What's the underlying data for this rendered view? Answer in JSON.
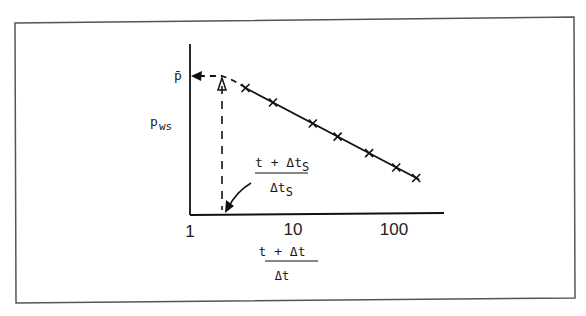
{
  "figure": {
    "y_axis_label": "p",
    "y_axis_label_sub": "ws",
    "y_marker_label": "p̄",
    "x_axis_label_numerator": "t + Δt",
    "x_axis_label_denominator": "Δt",
    "annotation_numerator": "t + Δt",
    "annotation_numerator_sub": "S",
    "annotation_denominator": "Δt",
    "annotation_denominator_sub": "S",
    "x_ticks": [
      "1",
      "10",
      "100"
    ],
    "x_scale": "log",
    "x_range": [
      1,
      200
    ],
    "points": [
      {
        "x": 3.5
      },
      {
        "x": 6.5
      },
      {
        "x": 16
      },
      {
        "x": 28
      },
      {
        "x": 57
      },
      {
        "x": 105
      },
      {
        "x": 165
      }
    ],
    "line_style": "solid",
    "extrapolation_style": "dashed",
    "colors": {
      "ink": "#1a1a1a",
      "frame": "#555555",
      "background": "#ffffff"
    }
  }
}
